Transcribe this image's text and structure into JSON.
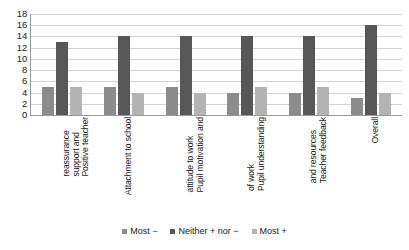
{
  "chart_data": {
    "type": "bar",
    "title": "",
    "subtitle": "",
    "xlabel": "",
    "ylabel": "",
    "ylim": [
      0,
      18
    ],
    "ytick_step": 2,
    "yticks": [
      "18",
      "16",
      "14",
      "12",
      "10",
      "8",
      "6",
      "4",
      "2",
      "0"
    ],
    "grid": true,
    "grid_axis": "y",
    "legend_position": "bottom",
    "orientation": "vertical",
    "grouping": "clustered",
    "categories": [
      "Positive teacher support and reassurance",
      "Attachment to school",
      "Pupil motivation and attitude to work",
      "Pupil understanding of work",
      "Teacher feedback and resources",
      "Overall"
    ],
    "category_lines": [
      [
        "Positive teacher",
        "support and",
        "reassurance"
      ],
      [
        "Attachment to school"
      ],
      [
        "Pupil motivation and",
        "attitude to work"
      ],
      [
        "Pupil understanding",
        "of work"
      ],
      [
        "Teacher feedback",
        "and resources"
      ],
      [
        "Overall"
      ]
    ],
    "series": [
      {
        "name": "Most −",
        "color": "#8c8c8c",
        "values": [
          5,
          5,
          5,
          4,
          4,
          3
        ]
      },
      {
        "name": "Neither + nor −",
        "color": "#575757",
        "values": [
          13,
          14,
          14,
          14,
          14,
          16
        ]
      },
      {
        "name": "Most +",
        "color": "#b3b3b3",
        "values": [
          5,
          4,
          4,
          5,
          5,
          4
        ]
      }
    ]
  },
  "colors": {
    "background": "#ffffff",
    "gridline": "#d4d4d4",
    "axis": "#9a9a9a",
    "text": "#1a1a1a",
    "series_most_minus": "#8c8c8c",
    "series_neither": "#575757",
    "series_most_plus": "#b3b3b3"
  }
}
